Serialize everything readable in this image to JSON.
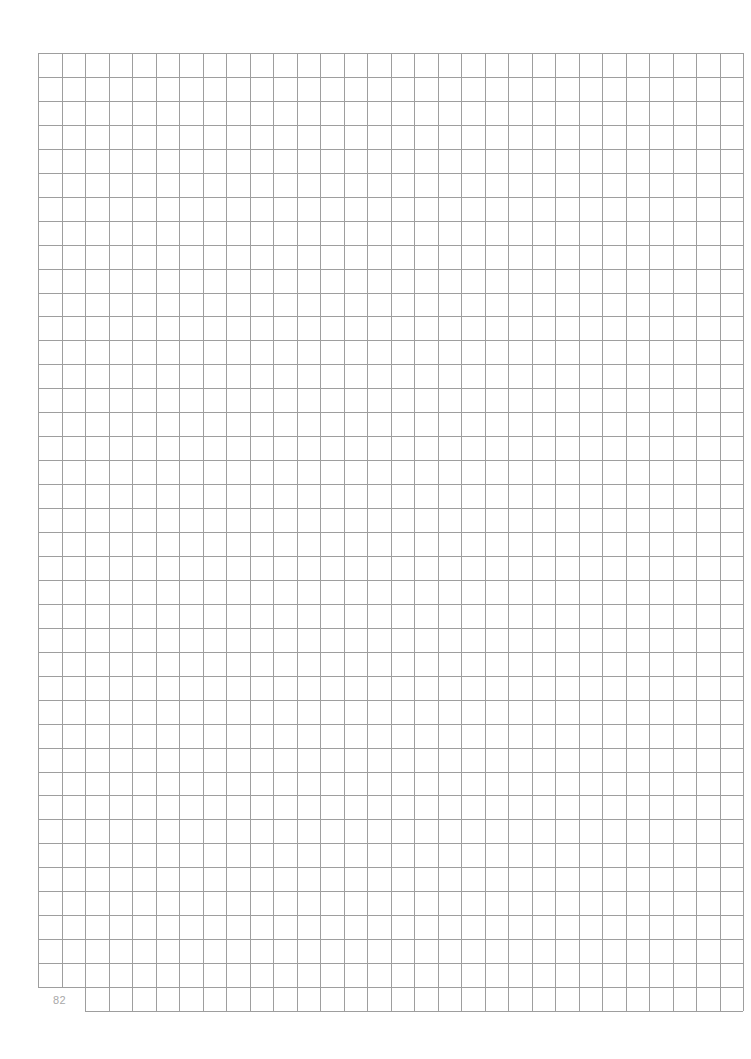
{
  "page": {
    "type": "graph-paper",
    "page_number": "82",
    "colors": {
      "background": "#ffffff",
      "grid_line": "#9e9e9e",
      "page_number": "#a8a8a8"
    },
    "grid": {
      "left": 38,
      "top": 53,
      "right": 743,
      "bottom": 1011,
      "columns": 30,
      "rows": 40,
      "notch": {
        "columns": 2,
        "rows": 1,
        "position": "bottom-left"
      }
    }
  }
}
